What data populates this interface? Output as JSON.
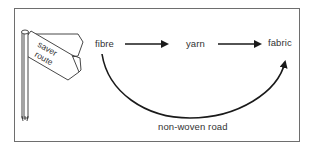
{
  "diagram": {
    "signpost": {
      "sign_text_line1": "saver",
      "sign_text_line2": "route"
    },
    "nodes": [
      {
        "id": "fibre",
        "label": "fibre"
      },
      {
        "id": "yarn",
        "label": "yarn"
      },
      {
        "id": "fabric",
        "label": "fabric"
      }
    ],
    "edges": [
      {
        "from": "fibre",
        "to": "yarn",
        "style": "straight-arrow"
      },
      {
        "from": "yarn",
        "to": "fabric",
        "style": "straight-arrow"
      },
      {
        "from": "fibre",
        "to": "fabric",
        "style": "curved-arrow",
        "label": "non-woven road"
      }
    ],
    "curve_label": "non-woven road",
    "colors": {
      "line": "#1a1a1a",
      "text": "#333333",
      "frame": "#6e6e6e"
    }
  }
}
